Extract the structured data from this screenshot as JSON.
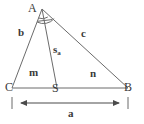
{
  "figure": {
    "kind": "geometry-diagram",
    "stroke_color": "#6b6b6b",
    "text_color": "#3a3a3a",
    "background": "#ffffff",
    "vertices": [
      {
        "name": "A",
        "label": "A",
        "x": 42,
        "y": 9
      },
      {
        "name": "C",
        "label": "C",
        "x": 12,
        "y": 88
      },
      {
        "name": "B",
        "label": "B",
        "x": 128,
        "y": 88
      },
      {
        "name": "S",
        "label": "S",
        "x": 57,
        "y": 88
      }
    ],
    "segments": [
      {
        "name": "side-b",
        "from": "A",
        "to": "C",
        "label": "b"
      },
      {
        "name": "side-c",
        "from": "A",
        "to": "B",
        "label": "c"
      },
      {
        "name": "side-a",
        "from": "C",
        "to": "B",
        "label": "a"
      },
      {
        "name": "median-sa",
        "from": "A",
        "to": "S",
        "label": "s"
      }
    ],
    "labels": {
      "vertex_a": "A",
      "vertex_b": "B",
      "vertex_c": "C",
      "vertex_s": "S",
      "side_b": "b",
      "side_c": "c",
      "side_a": "a",
      "segment_m": "m",
      "segment_n": "n",
      "median_base": "s",
      "median_subscript": "a"
    },
    "angle_marks": {
      "count": 2,
      "at_vertex": "A",
      "note": "two arcs at apex marking equal angles"
    },
    "dimension_line": {
      "name": "a",
      "label": "a",
      "from_x": 12,
      "to_x": 128,
      "y": 103,
      "arrows": "both",
      "extension_ticks": true
    }
  }
}
